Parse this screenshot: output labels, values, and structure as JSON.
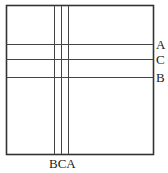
{
  "diagram": {
    "horizontal_lines": [
      {
        "label": "A",
        "order": 1
      },
      {
        "label": "C",
        "order": 2
      },
      {
        "label": "B",
        "order": 3
      }
    ],
    "vertical_lines": [
      {
        "label": "B",
        "order": 1
      },
      {
        "label": "C",
        "order": 2
      },
      {
        "label": "A",
        "order": 3
      }
    ],
    "bottom_label": "BCA",
    "colors": {
      "line": "#444444",
      "frame": "#333333",
      "background": "#ffffff"
    }
  }
}
